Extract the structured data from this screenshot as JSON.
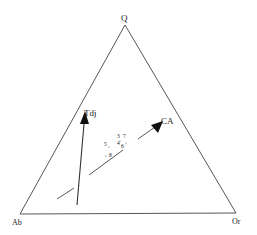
{
  "diagram": {
    "type": "ternary",
    "vertices": {
      "top": "Q",
      "bottom_left": "Ab",
      "bottom_right": "Or"
    },
    "trends": [
      {
        "label": "Tdj",
        "description": "near-vertical arrow pointing toward Q"
      },
      {
        "label": "CA",
        "description": "arrow pointing up-right along calc-alkaline trend"
      }
    ],
    "sample_labels": [
      "3",
      "7",
      "4",
      "6",
      "5",
      "8"
    ],
    "sample_labels_note": "best-effort reading; labels are tiny and partly illegible"
  }
}
